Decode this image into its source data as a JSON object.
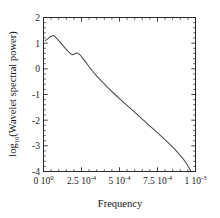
{
  "chart_data": {
    "type": "line",
    "title": "",
    "xlabel": "Frequency",
    "ylabel": "log10(Wavelet spectral power)",
    "ylabel_parts": {
      "base": "log",
      "subscript": "10",
      "rest": "(Wavelet spectral power)"
    },
    "xlim": [
      0,
      0.001
    ],
    "ylim": [
      -4,
      2
    ],
    "grid": false,
    "legend": null,
    "xticks": [
      0,
      0.00025,
      0.0005,
      0.00075,
      0.001
    ],
    "xticklabels": [
      "0 10",
      "2.5 10",
      "5 10",
      "7.5 10",
      "1 10"
    ],
    "xtick_exponents": [
      "0",
      "-4",
      "-4",
      "-4",
      "-3"
    ],
    "yticks": [
      2,
      1,
      0,
      -1,
      -2,
      -3,
      -4
    ],
    "yticklabels": [
      "2",
      "1",
      "0",
      "-1",
      "-2",
      "-3",
      "-4"
    ],
    "minor_ticks_per_major": 4,
    "tick_direction": "in",
    "series": [
      {
        "name": "wavelet spectrum",
        "color": "#4a4a4a",
        "x": [
          1.2e-05,
          3e-05,
          4.8e-05,
          6.8e-05,
          8.2e-05,
          0.0001,
          0.000122,
          0.000143,
          0.000162,
          0.00018,
          0.000196,
          0.000208,
          0.000222,
          0.00024,
          0.000268,
          0.0003,
          0.00034,
          0.000382,
          0.000425,
          0.00047,
          0.000515,
          0.00056,
          0.000605,
          0.00065,
          0.000695,
          0.00074,
          0.000785,
          0.000825,
          0.000862,
          0.000895,
          0.00092,
          0.000942,
          0.000958,
          0.000968
        ],
        "y": [
          1.1,
          1.18,
          1.27,
          1.3,
          1.22,
          1.1,
          0.95,
          0.8,
          0.68,
          0.58,
          0.55,
          0.6,
          0.62,
          0.55,
          0.34,
          0.08,
          -0.22,
          -0.48,
          -0.74,
          -1.0,
          -1.24,
          -1.48,
          -1.72,
          -1.96,
          -2.2,
          -2.44,
          -2.68,
          -2.9,
          -3.12,
          -3.34,
          -3.52,
          -3.7,
          -3.86,
          -3.97
        ]
      }
    ]
  },
  "axis_titles": {
    "x": "Frequency"
  }
}
